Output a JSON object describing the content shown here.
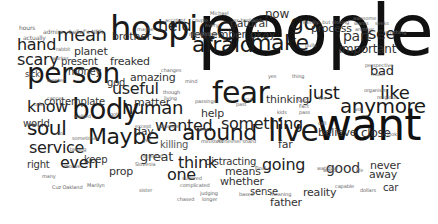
{
  "cloud": {
    "background": "#ffffff",
    "words": [
      {
        "text": "people",
        "x": 197,
        "y": 52,
        "size": 72,
        "color": "#111111"
      },
      {
        "text": "want",
        "x": 316,
        "y": 138,
        "size": 44,
        "color": "#111111"
      },
      {
        "text": "hospice",
        "x": 110,
        "y": 38,
        "size": 34,
        "color": "#1a1a1a"
      },
      {
        "text": "fear",
        "x": 212,
        "y": 102,
        "size": 30,
        "color": "#1a1a1a"
      },
      {
        "text": "person",
        "x": 27,
        "y": 82,
        "size": 28,
        "color": "#1a1a1a"
      },
      {
        "text": "body",
        "x": 72,
        "y": 118,
        "size": 28,
        "color": "#1a1a1a"
      },
      {
        "text": "live",
        "x": 268,
        "y": 140,
        "size": 30,
        "color": "#1a1a1a"
      },
      {
        "text": "afraid",
        "x": 192,
        "y": 52,
        "size": 22,
        "color": "#1a1a1a"
      },
      {
        "text": "make",
        "x": 250,
        "y": 50,
        "size": 22,
        "color": "#1a1a1a"
      },
      {
        "text": "go",
        "x": 290,
        "y": 30,
        "size": 22,
        "color": "#1a1a1a"
      },
      {
        "text": "Maybe",
        "x": 88,
        "y": 144,
        "size": 22,
        "color": "#1a1a1a"
      },
      {
        "text": "around",
        "x": 182,
        "y": 140,
        "size": 22,
        "color": "#1a1a1a"
      },
      {
        "text": "anymore",
        "x": 340,
        "y": 112,
        "size": 20,
        "color": "#1a1a1a"
      },
      {
        "text": "just",
        "x": 308,
        "y": 98,
        "size": 18,
        "color": "#1a1a1a"
      },
      {
        "text": "like",
        "x": 380,
        "y": 98,
        "size": 18,
        "color": "#1a1a1a"
      },
      {
        "text": "human",
        "x": 122,
        "y": 113,
        "size": 18,
        "color": "#1a1a1a"
      },
      {
        "text": "soul",
        "x": 27,
        "y": 134,
        "size": 20,
        "color": "#1a1a1a"
      },
      {
        "text": "mean",
        "x": 57,
        "y": 40,
        "size": 18,
        "color": "#222222"
      },
      {
        "text": "hand",
        "x": 17,
        "y": 50,
        "size": 16,
        "color": "#222222"
      },
      {
        "text": "scary",
        "x": 17,
        "y": 65,
        "size": 16,
        "color": "#222222"
      },
      {
        "text": "know",
        "x": 27,
        "y": 112,
        "size": 16,
        "color": "#222222"
      },
      {
        "text": "service",
        "x": 29,
        "y": 153,
        "size": 16,
        "color": "#222222"
      },
      {
        "text": "even",
        "x": 60,
        "y": 168,
        "size": 16,
        "color": "#222222"
      },
      {
        "text": "useful",
        "x": 112,
        "y": 94,
        "size": 16,
        "color": "#222222"
      },
      {
        "text": "wanted",
        "x": 155,
        "y": 131,
        "size": 16,
        "color": "#222222"
      },
      {
        "text": "held",
        "x": 158,
        "y": 31,
        "size": 16,
        "color": "#222222"
      },
      {
        "text": "something",
        "x": 221,
        "y": 129,
        "size": 16,
        "color": "#222222"
      },
      {
        "text": "going",
        "x": 262,
        "y": 170,
        "size": 16,
        "color": "#222222"
      },
      {
        "text": "think",
        "x": 178,
        "y": 168,
        "size": 16,
        "color": "#222222"
      },
      {
        "text": "one",
        "x": 167,
        "y": 180,
        "size": 16,
        "color": "#222222"
      },
      {
        "text": "see",
        "x": 368,
        "y": 39,
        "size": 16,
        "color": "#222222"
      },
      {
        "text": "bad",
        "x": 370,
        "y": 74,
        "size": 13,
        "color": "#222222"
      },
      {
        "text": "anymore",
        "x": 0,
        "y": 0,
        "size": 0,
        "color": "#ffffff"
      },
      {
        "text": "great",
        "x": 140,
        "y": 160,
        "size": 13,
        "color": "#333333"
      },
      {
        "text": "close",
        "x": 361,
        "y": 137,
        "size": 12,
        "color": "#333333"
      },
      {
        "text": "part",
        "x": 343,
        "y": 40,
        "size": 14,
        "color": "#333333"
      },
      {
        "text": "important",
        "x": 339,
        "y": 53,
        "size": 12,
        "color": "#333333"
      },
      {
        "text": "process",
        "x": 311,
        "y": 32,
        "size": 11,
        "color": "#333333"
      },
      {
        "text": "good",
        "x": 326,
        "y": 172,
        "size": 14,
        "color": "#333333"
      },
      {
        "text": "never",
        "x": 370,
        "y": 169,
        "size": 11,
        "color": "#333333"
      },
      {
        "text": "away",
        "x": 369,
        "y": 178,
        "size": 11,
        "color": "#333333"
      },
      {
        "text": "car",
        "x": 383,
        "y": 191,
        "size": 10,
        "color": "#333333"
      },
      {
        "text": "reality",
        "x": 303,
        "y": 196,
        "size": 11,
        "color": "#333333"
      },
      {
        "text": "father",
        "x": 270,
        "y": 206,
        "size": 11,
        "color": "#333333"
      },
      {
        "text": "sense",
        "x": 250,
        "y": 195,
        "size": 10,
        "color": "#333333"
      },
      {
        "text": "whether",
        "x": 220,
        "y": 185,
        "size": 11,
        "color": "#333333"
      },
      {
        "text": "means",
        "x": 225,
        "y": 175,
        "size": 11,
        "color": "#333333"
      },
      {
        "text": "distracting",
        "x": 205,
        "y": 165,
        "size": 10,
        "color": "#333333"
      },
      {
        "text": "thinking",
        "x": 266,
        "y": 103,
        "size": 11,
        "color": "#333333"
      },
      {
        "text": "believe",
        "x": 318,
        "y": 136,
        "size": 11,
        "color": "#333333"
      },
      {
        "text": "far",
        "x": 278,
        "y": 148,
        "size": 11,
        "color": "#333333"
      },
      {
        "text": "remember",
        "x": 190,
        "y": 38,
        "size": 11,
        "color": "#333333"
      },
      {
        "text": "natural",
        "x": 230,
        "y": 27,
        "size": 11,
        "color": "#333333"
      },
      {
        "text": "okay",
        "x": 250,
        "y": 38,
        "size": 11,
        "color": "#333333"
      },
      {
        "text": "now",
        "x": 265,
        "y": 18,
        "size": 12,
        "color": "#333333"
      },
      {
        "text": "brother",
        "x": 112,
        "y": 40,
        "size": 11,
        "color": "#333333"
      },
      {
        "text": "freaked",
        "x": 110,
        "y": 65,
        "size": 11,
        "color": "#333333"
      },
      {
        "text": "amazing",
        "x": 130,
        "y": 81,
        "size": 11,
        "color": "#333333"
      },
      {
        "text": "god",
        "x": 107,
        "y": 86,
        "size": 10,
        "color": "#333333"
      },
      {
        "text": "present",
        "x": 61,
        "y": 65,
        "size": 10,
        "color": "#333333"
      },
      {
        "text": "planet",
        "x": 74,
        "y": 55,
        "size": 11,
        "color": "#333333"
      },
      {
        "text": "money",
        "x": 68,
        "y": 75,
        "size": 10,
        "color": "#333333"
      },
      {
        "text": "sick",
        "x": 25,
        "y": 77,
        "size": 8,
        "color": "#333333"
      },
      {
        "text": "contemplate",
        "x": 44,
        "y": 105,
        "size": 10,
        "color": "#333333"
      },
      {
        "text": "matter",
        "x": 134,
        "y": 106,
        "size": 11,
        "color": "#333333"
      },
      {
        "text": "help",
        "x": 201,
        "y": 117,
        "size": 11,
        "color": "#333333"
      },
      {
        "text": "day",
        "x": 134,
        "y": 135,
        "size": 11,
        "color": "#333333"
      },
      {
        "text": "world",
        "x": 23,
        "y": 127,
        "size": 10,
        "color": "#333333"
      },
      {
        "text": "right",
        "x": 27,
        "y": 168,
        "size": 10,
        "color": "#333333"
      },
      {
        "text": "keep",
        "x": 84,
        "y": 163,
        "size": 10,
        "color": "#333333"
      },
      {
        "text": "prop",
        "x": 109,
        "y": 175,
        "size": 11,
        "color": "#333333"
      },
      {
        "text": "actually",
        "x": 23,
        "y": 40,
        "size": 6,
        "color": "#666666"
      },
      {
        "text": "hours",
        "x": 19,
        "y": 30,
        "size": 6,
        "color": "#666666"
      },
      {
        "text": "admire",
        "x": 43,
        "y": 34,
        "size": 6,
        "color": "#666666"
      },
      {
        "text": "belief's NPR",
        "x": 69,
        "y": 34,
        "size": 6,
        "color": "#666666"
      },
      {
        "text": "rabbit",
        "x": 56,
        "y": 51,
        "size": 5,
        "color": "#666666"
      },
      {
        "text": "worker",
        "x": 52,
        "y": 60,
        "size": 5,
        "color": "#666666"
      },
      {
        "text": "reenter",
        "x": 47,
        "y": 82,
        "size": 5,
        "color": "#666666"
      },
      {
        "text": "cancer",
        "x": 47,
        "y": 100,
        "size": 5,
        "color": "#666666"
      },
      {
        "text": "talk",
        "x": 34,
        "y": 106,
        "size": 5,
        "color": "#666666"
      },
      {
        "text": "walked",
        "x": 74,
        "y": 118,
        "size": 5,
        "color": "#666666"
      },
      {
        "text": "got",
        "x": 110,
        "y": 116,
        "size": 5,
        "color": "#666666"
      },
      {
        "text": "seen",
        "x": 26,
        "y": 126,
        "size": 5,
        "color": "#666666"
      },
      {
        "text": "to",
        "x": 58,
        "y": 135,
        "size": 5,
        "color": "#666666"
      },
      {
        "text": "sometimes",
        "x": 72,
        "y": 140,
        "size": 5,
        "color": "#666666"
      },
      {
        "text": "talking",
        "x": 70,
        "y": 151,
        "size": 5,
        "color": "#666666"
      },
      {
        "text": "motive",
        "x": 64,
        "y": 168,
        "size": 5,
        "color": "#666666"
      },
      {
        "text": "many",
        "x": 42,
        "y": 178,
        "size": 5,
        "color": "#666666"
      },
      {
        "text": "Cuz Oakland",
        "x": 52,
        "y": 189,
        "size": 5,
        "color": "#666666"
      },
      {
        "text": "Marilyn",
        "x": 87,
        "y": 187,
        "size": 5,
        "color": "#666666"
      },
      {
        "text": "maybe",
        "x": 137,
        "y": 31,
        "size": 5,
        "color": "#666666"
      },
      {
        "text": "accident",
        "x": 165,
        "y": 22,
        "size": 5,
        "color": "#666666"
      },
      {
        "text": "couple",
        "x": 192,
        "y": 22,
        "size": 5,
        "color": "#666666"
      },
      {
        "text": "every",
        "x": 205,
        "y": 27,
        "size": 5,
        "color": "#666666"
      },
      {
        "text": "Michael",
        "x": 210,
        "y": 15,
        "size": 5,
        "color": "#666666"
      },
      {
        "text": "relationship",
        "x": 189,
        "y": 36,
        "size": 5,
        "color": "#666666"
      },
      {
        "text": "ex-husband",
        "x": 233,
        "y": 22,
        "size": 5,
        "color": "#666666"
      },
      {
        "text": "Family...but visiting",
        "x": 303,
        "y": 24,
        "size": 5,
        "color": "#666666"
      },
      {
        "text": "awesome",
        "x": 353,
        "y": 20,
        "size": 5,
        "color": "#666666"
      },
      {
        "text": "wants",
        "x": 354,
        "y": 25,
        "size": 5,
        "color": "#666666"
      },
      {
        "text": "seeks",
        "x": 375,
        "y": 25,
        "size": 5,
        "color": "#666666"
      },
      {
        "text": "another",
        "x": 355,
        "y": 31,
        "size": 5,
        "color": "#666666"
      },
      {
        "text": "anything",
        "x": 385,
        "y": 34,
        "size": 5,
        "color": "#666666"
      },
      {
        "text": "pulls",
        "x": 305,
        "y": 47,
        "size": 5,
        "color": "#666666"
      },
      {
        "text": "perspective",
        "x": 365,
        "y": 67,
        "size": 5,
        "color": "#666666"
      },
      {
        "text": "much",
        "x": 371,
        "y": 76,
        "size": 5,
        "color": "#666666"
      },
      {
        "text": "organism",
        "x": 364,
        "y": 92,
        "size": 5,
        "color": "#666666"
      },
      {
        "text": "religious",
        "x": 377,
        "y": 99,
        "size": 5,
        "color": "#666666"
      },
      {
        "text": "ask",
        "x": 354,
        "y": 111,
        "size": 5,
        "color": "#666666"
      },
      {
        "text": "look",
        "x": 387,
        "y": 136,
        "size": 5,
        "color": "#666666"
      },
      {
        "text": "changes",
        "x": 161,
        "y": 72,
        "size": 5,
        "color": "#666666"
      },
      {
        "text": "mind",
        "x": 185,
        "y": 83,
        "size": 5,
        "color": "#666666"
      },
      {
        "text": "though",
        "x": 163,
        "y": 94,
        "size": 5,
        "color": "#666666"
      },
      {
        "text": "living",
        "x": 164,
        "y": 100,
        "size": 5,
        "color": "#666666"
      },
      {
        "text": "passings",
        "x": 195,
        "y": 103,
        "size": 5,
        "color": "#666666"
      },
      {
        "text": "yes",
        "x": 268,
        "y": 78,
        "size": 5,
        "color": "#666666"
      },
      {
        "text": "thing",
        "x": 292,
        "y": 78,
        "size": 5,
        "color": "#666666"
      },
      {
        "text": "cut",
        "x": 245,
        "y": 101,
        "size": 5,
        "color": "#666666"
      },
      {
        "text": "past",
        "x": 236,
        "y": 106,
        "size": 5,
        "color": "#666666"
      },
      {
        "text": "kids",
        "x": 277,
        "y": 114,
        "size": 5,
        "color": "#666666"
      },
      {
        "text": "God",
        "x": 298,
        "y": 102,
        "size": 5,
        "color": "#666666"
      },
      {
        "text": "Yes",
        "x": 318,
        "y": 100,
        "size": 5,
        "color": "#666666"
      },
      {
        "text": "Fact",
        "x": 299,
        "y": 108,
        "size": 5,
        "color": "#666666"
      },
      {
        "text": "pass",
        "x": 299,
        "y": 114,
        "size": 5,
        "color": "#666666"
      },
      {
        "text": "call",
        "x": 318,
        "y": 125,
        "size": 5,
        "color": "#666666"
      },
      {
        "text": "year",
        "x": 198,
        "y": 131,
        "size": 5,
        "color": "#666666"
      },
      {
        "text": "except",
        "x": 135,
        "y": 128,
        "size": 5,
        "color": "#666666"
      },
      {
        "text": "evidence",
        "x": 157,
        "y": 128,
        "size": 5,
        "color": "#666666"
      },
      {
        "text": "yet",
        "x": 143,
        "y": 142,
        "size": 5,
        "color": "#666666"
      },
      {
        "text": "ministers",
        "x": 201,
        "y": 143,
        "size": 5,
        "color": "#666666"
      },
      {
        "text": "Alzheimer's",
        "x": 217,
        "y": 143,
        "size": 5,
        "color": "#666666"
      },
      {
        "text": "hard",
        "x": 245,
        "y": 143,
        "size": 5,
        "color": "#666666"
      },
      {
        "text": "killing",
        "x": 160,
        "y": 148,
        "size": 10,
        "color": "#555555"
      },
      {
        "text": "scientist",
        "x": 143,
        "y": 158,
        "size": 5,
        "color": "#666666"
      },
      {
        "text": "Slovenia",
        "x": 135,
        "y": 166,
        "size": 5,
        "color": "#666666"
      },
      {
        "text": "suffered",
        "x": 182,
        "y": 180,
        "size": 5,
        "color": "#666666"
      },
      {
        "text": "complicated",
        "x": 180,
        "y": 187,
        "size": 5,
        "color": "#666666"
      },
      {
        "text": "sister",
        "x": 139,
        "y": 192,
        "size": 5,
        "color": "#666666"
      },
      {
        "text": "judging",
        "x": 200,
        "y": 195,
        "size": 5,
        "color": "#666666"
      },
      {
        "text": "longer",
        "x": 202,
        "y": 201,
        "size": 5,
        "color": "#666666"
      },
      {
        "text": "chased",
        "x": 177,
        "y": 201,
        "size": 5,
        "color": "#666666"
      },
      {
        "text": "based",
        "x": 239,
        "y": 196,
        "size": 5,
        "color": "#666666"
      },
      {
        "text": "meaning",
        "x": 270,
        "y": 196,
        "size": 5,
        "color": "#666666"
      },
      {
        "text": "Final",
        "x": 255,
        "y": 170,
        "size": 5,
        "color": "#666666"
      },
      {
        "text": "watched",
        "x": 317,
        "y": 170,
        "size": 5,
        "color": "#666666"
      },
      {
        "text": "life",
        "x": 356,
        "y": 172,
        "size": 5,
        "color": "#666666"
      },
      {
        "text": "capable",
        "x": 335,
        "y": 188,
        "size": 5,
        "color": "#666666"
      },
      {
        "text": "dollars",
        "x": 360,
        "y": 192,
        "size": 5,
        "color": "#666666"
      },
      {
        "text": "world",
        "x": 323,
        "y": 172,
        "size": 5,
        "color": "#666666"
      }
    ]
  }
}
